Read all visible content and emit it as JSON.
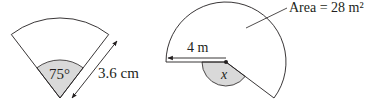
{
  "figures": [
    {
      "id": "sector-left",
      "angle_label": "75°",
      "length_label": "3.6 cm",
      "angle_deg": 75,
      "radius_value": "3.6",
      "radius_unit": "cm"
    },
    {
      "id": "sector-right",
      "radius_label": "4 m",
      "angle_label": "x",
      "area_label": "Area = 28 m²",
      "area_value": "28",
      "area_unit": "m²"
    }
  ],
  "colors": {
    "stroke": "#231f20",
    "shade": "#d9d9d9",
    "background": "#ffffff"
  }
}
